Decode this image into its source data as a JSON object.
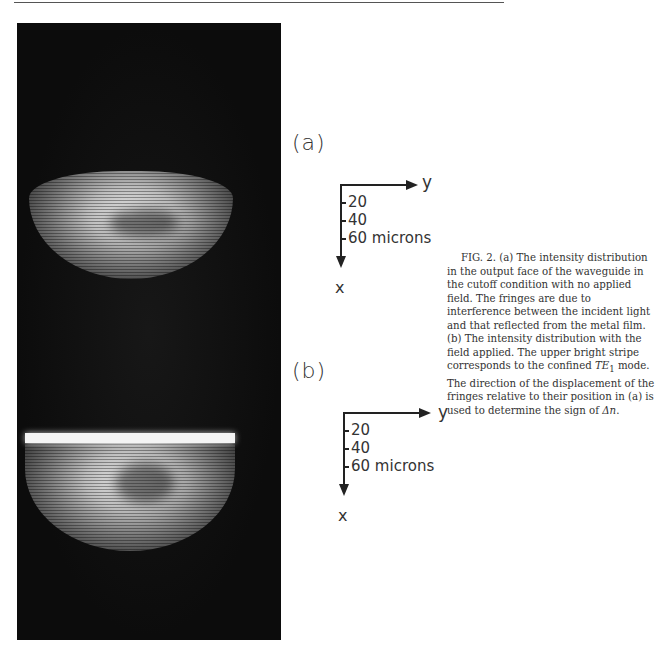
{
  "figure": {
    "panels": [
      {
        "label": "(a)",
        "axes": {
          "x_label": "x",
          "y_label": "y",
          "ticks": [
            "20",
            "40",
            "60 microns"
          ]
        }
      },
      {
        "label": "(b)",
        "axes": {
          "x_label": "x",
          "y_label": "y",
          "ticks": [
            "20",
            "40",
            "60 microns"
          ]
        }
      }
    ],
    "caption": {
      "lead": "FIG. 2.",
      "text_1": " (a) The intensity distribution in the output face of the waveguide in the cutoff condition with no applied field. The fringes are due to interference between the incident light and that reflected from the metal film. (b) The intensity distribution with the field applied. The upper bright stripe corresponds to the confined ",
      "mode": "TE",
      "mode_subscript": "1",
      "text_2": " mode. The direction of the displacement of the fringes relative to their position in (a) is used to determine the sign of ",
      "symbol": "Δn",
      "text_3": "."
    }
  }
}
